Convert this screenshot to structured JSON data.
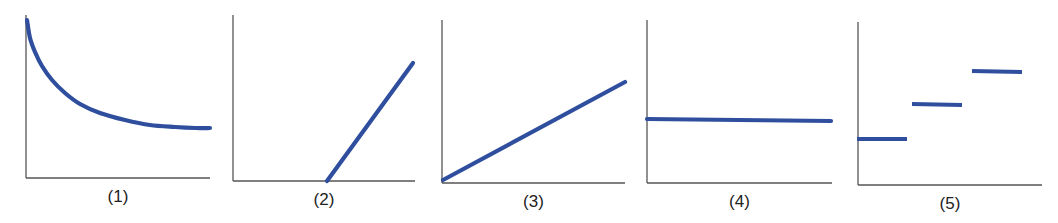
{
  "colors": {
    "axis": "#555555",
    "line": "#2f4f9e"
  },
  "chart_data": [
    {
      "type": "line",
      "label": "(1)",
      "title": "",
      "xlabel": "",
      "ylabel": "",
      "shape": "decreasing curve approaching a horizontal asymptote",
      "grid": false,
      "axes_px": {
        "x0": 26,
        "y0": 178,
        "x1": 210,
        "ytop": 15
      },
      "points_px": [
        [
          27,
          20
        ],
        [
          30,
          38
        ],
        [
          35,
          52
        ],
        [
          42,
          66
        ],
        [
          52,
          80
        ],
        [
          65,
          93
        ],
        [
          80,
          104
        ],
        [
          100,
          113
        ],
        [
          125,
          120
        ],
        [
          150,
          125
        ],
        [
          175,
          127
        ],
        [
          195,
          128
        ],
        [
          210,
          128
        ]
      ]
    },
    {
      "type": "line",
      "label": "(2)",
      "title": "",
      "xlabel": "",
      "ylabel": "",
      "shape": "straight line with positive slope, x-intercept at about the middle of the axis",
      "grid": false,
      "axes_px": {
        "x0": 233,
        "y0": 181,
        "x1": 415,
        "ytop": 15
      },
      "points_px": [
        [
          327,
          181
        ],
        [
          413,
          63
        ]
      ]
    },
    {
      "type": "line",
      "label": "(3)",
      "title": "",
      "xlabel": "",
      "ylabel": "",
      "shape": "straight line through the origin with positive slope",
      "grid": false,
      "axes_px": {
        "x0": 442,
        "y0": 183,
        "x1": 625,
        "ytop": 20
      },
      "points_px": [
        [
          443,
          180
        ],
        [
          625,
          82
        ]
      ]
    },
    {
      "type": "line",
      "label": "(4)",
      "title": "",
      "xlabel": "",
      "ylabel": "",
      "shape": "horizontal line (constant)",
      "grid": false,
      "axes_px": {
        "x0": 647,
        "y0": 183,
        "x1": 832,
        "ytop": 20
      },
      "points_px": [
        [
          647,
          119
        ],
        [
          831,
          121
        ]
      ]
    },
    {
      "type": "line",
      "label": "(5)",
      "title": "",
      "xlabel": "",
      "ylabel": "",
      "shape": "step function with three increasing discrete levels",
      "grid": false,
      "axes_px": {
        "x0": 858,
        "y0": 185,
        "x1": 1042,
        "ytop": 22
      },
      "segments_px": [
        [
          [
            857,
            139
          ],
          [
            907,
            139
          ]
        ],
        [
          [
            912,
            104
          ],
          [
            962,
            105
          ]
        ],
        [
          [
            972,
            71
          ],
          [
            1022,
            72
          ]
        ]
      ]
    }
  ]
}
